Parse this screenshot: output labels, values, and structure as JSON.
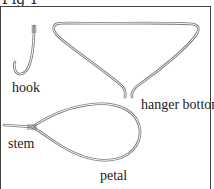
{
  "figure": {
    "title": "Fig 1",
    "labels": {
      "hook": "hook",
      "hanger_bottom": "hanger bottom",
      "stem": "stem",
      "petal": "petal"
    }
  }
}
